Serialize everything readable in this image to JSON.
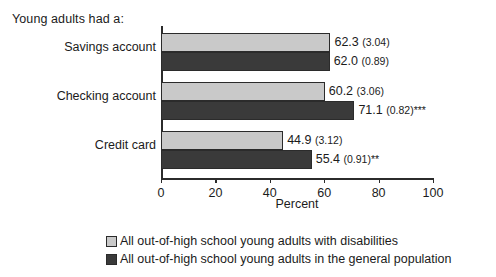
{
  "caption": "Young adults had a:",
  "legend": {
    "items": [
      {
        "label": "All out-of-high school young adults with disabilities",
        "swatch": "light",
        "color": "#c9c9c9"
      },
      {
        "label": "All out-of-high school young adults in the general population",
        "swatch": "dark",
        "color": "#3a3a3a"
      }
    ]
  },
  "chart_data": {
    "type": "bar",
    "orientation": "horizontal",
    "title": "Young adults had a:",
    "xlabel": "Percent",
    "ylabel": "",
    "xlim": [
      0,
      100
    ],
    "xticks": [
      "0",
      "20",
      "40",
      "60",
      "80",
      "100"
    ],
    "grid": false,
    "legend_position": "bottom",
    "categories": [
      "Savings account",
      "Checking account",
      "Credit card"
    ],
    "series": [
      {
        "name": "All out-of-high school young adults with disabilities",
        "color": "#c9c9c9",
        "values": [
          62.3,
          60.2,
          44.9
        ],
        "standard_errors": [
          3.04,
          3.06,
          3.12
        ],
        "labels": [
          "62.3 (3.04)",
          "60.2 (3.06)",
          "44.9 (3.12)"
        ],
        "significance": [
          "",
          "",
          ""
        ]
      },
      {
        "name": "All out-of-high school young adults in the general population",
        "color": "#3a3a3a",
        "values": [
          62.0,
          71.1,
          55.4
        ],
        "standard_errors": [
          0.89,
          0.82,
          0.91
        ],
        "labels": [
          "62.0 (0.89)",
          "71.1 (0.82)",
          "55.4 (0.91)"
        ],
        "significance": [
          "",
          "***",
          "**"
        ]
      }
    ],
    "bar_labels": [
      {
        "value": "62.3",
        "se": "(3.04)",
        "stars": ""
      },
      {
        "value": "62.0",
        "se": "(0.89)",
        "stars": ""
      },
      {
        "value": "60.2",
        "se": "(3.06)",
        "stars": ""
      },
      {
        "value": "71.1",
        "se": "(0.82)",
        "stars": "***"
      },
      {
        "value": "44.9",
        "se": "(3.12)",
        "stars": ""
      },
      {
        "value": "55.4",
        "se": "(0.91)",
        "stars": "**"
      }
    ]
  },
  "axis": {
    "ticks": [
      {
        "label": "0",
        "value": 0
      },
      {
        "label": "20",
        "value": 20
      },
      {
        "label": "40",
        "value": 40
      },
      {
        "label": "60",
        "value": 60
      },
      {
        "label": "80",
        "value": 80
      },
      {
        "label": "100",
        "value": 100
      }
    ],
    "title": "Percent"
  }
}
